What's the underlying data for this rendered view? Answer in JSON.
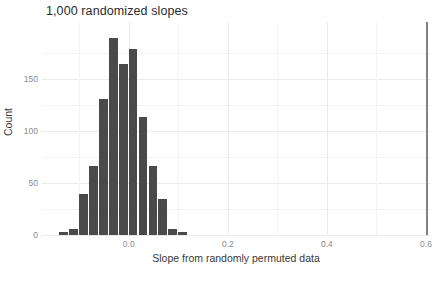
{
  "chart_data": {
    "type": "bar",
    "title": "1,000 randomized slopes",
    "xlabel": "Slope from randomly permuted data",
    "ylabel": "Count",
    "xlim": [
      -0.175,
      0.608
    ],
    "ylim": [
      0,
      205
    ],
    "grid": true,
    "legend": null,
    "bin_width": 0.02,
    "bar_color": "#4a4a4a",
    "categories": [
      -0.13,
      -0.11,
      -0.09,
      -0.07,
      -0.05,
      -0.03,
      -0.01,
      0.01,
      0.03,
      0.05,
      0.07,
      0.09,
      0.11
    ],
    "values": [
      3,
      6,
      39,
      66,
      131,
      190,
      165,
      179,
      114,
      66,
      35,
      6,
      3
    ],
    "xticks": [
      {
        "value": 0.0,
        "label": "0.0"
      },
      {
        "value": 0.2,
        "label": "0.2"
      },
      {
        "value": 0.4,
        "label": "0.4"
      },
      {
        "value": 0.6,
        "label": "0.6"
      }
    ],
    "yticks": [
      {
        "value": 0,
        "label": "0"
      },
      {
        "value": 50,
        "label": "50"
      },
      {
        "value": 100,
        "label": "100"
      },
      {
        "value": 150,
        "label": "150"
      }
    ],
    "annotations": [
      {
        "name": "observed-slope-line",
        "type": "vline",
        "x": 0.6,
        "color": "#828282"
      }
    ]
  }
}
